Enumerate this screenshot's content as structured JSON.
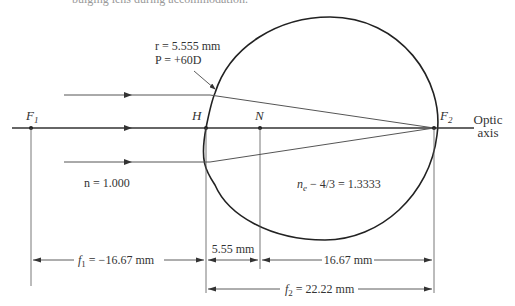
{
  "caption": "bulging lens during accommodation.",
  "labels": {
    "F1": "F",
    "F1_sub": "1",
    "H": "H",
    "N": "N",
    "F2": "F",
    "F2_sub": "2",
    "optic_axis_line1": "Optic",
    "optic_axis_line2": "axis",
    "cornea_radius": "r = 5.555 mm",
    "cornea_power": "P = +60D",
    "n_outside": "n = 1.000",
    "n_eye": "n",
    "n_eye_sub": "e",
    "n_eye_value": " − 4/3 = 1.3333"
  },
  "dimensions": {
    "f1": {
      "symbol": "f",
      "sub": "1",
      "value": " = −16.67 mm"
    },
    "h_to_n": {
      "value": "5.55 mm"
    },
    "n_to_f2": {
      "value": "16.67 mm"
    },
    "f2": {
      "symbol": "f",
      "sub": "2",
      "value": " = 22.22 mm"
    }
  },
  "colors": {
    "line": "#333333",
    "ray": "#555555",
    "caption": "#999999"
  }
}
